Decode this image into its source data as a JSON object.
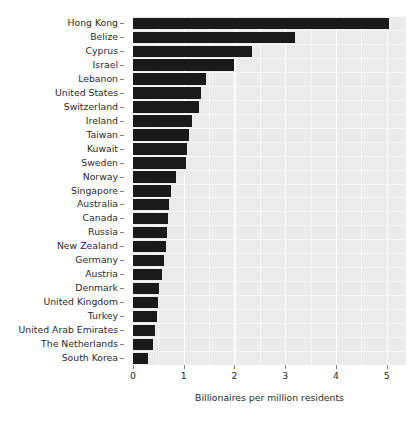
{
  "chart_data": {
    "type": "bar",
    "orientation": "horizontal",
    "title": "",
    "xlabel": "Billionaires per million residents",
    "ylabel": "",
    "xlim": [
      0,
      5.38
    ],
    "ylim": null,
    "grid": true,
    "legend": null,
    "xticks": [
      0,
      1,
      2,
      3,
      4,
      5
    ],
    "xtick_labels": [
      "0",
      "1",
      "2",
      "3",
      "4",
      "5"
    ],
    "xminor_ticks": [
      0.5,
      1.5,
      2.5,
      3.5,
      4.5
    ],
    "bar_color": "#1a1a1a",
    "panel_color": "#ebebeb",
    "gridline_color": "#ffffff",
    "categories": [
      "Hong Kong",
      "Belize",
      "Cyprus",
      "Israel",
      "Lebanon",
      "United States",
      "Switzerland",
      "Ireland",
      "Taiwan",
      "Kuwait",
      "Sweden",
      "Norway",
      "Singapore",
      "Australia",
      "Canada",
      "Russia",
      "New Zealand",
      "Germany",
      "Austria",
      "Denmark",
      "United Kingdom",
      "Turkey",
      "United Arab Emirates",
      "The Netherlands",
      "South Korea"
    ],
    "values": [
      5.05,
      3.2,
      2.35,
      2.0,
      1.44,
      1.34,
      1.3,
      1.16,
      1.1,
      1.07,
      1.04,
      0.85,
      0.75,
      0.71,
      0.69,
      0.67,
      0.65,
      0.61,
      0.57,
      0.51,
      0.49,
      0.47,
      0.43,
      0.39,
      0.3
    ]
  }
}
